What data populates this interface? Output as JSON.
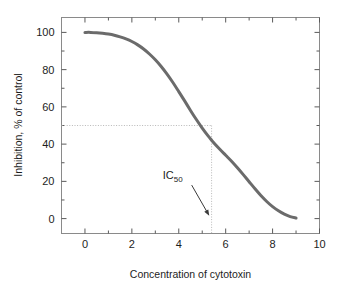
{
  "chart_data": {
    "type": "line",
    "title": "",
    "xlabel": "Concentration of cytotoxin",
    "ylabel": "Inhibition, % of control",
    "xlim": [
      -1,
      10
    ],
    "ylim": [
      -8,
      108
    ],
    "grid": false,
    "legend": null,
    "x_ticks": [
      "0",
      "2",
      "4",
      "6",
      "8",
      "10"
    ],
    "x_tick_values": [
      0,
      2,
      4,
      6,
      8,
      10
    ],
    "x_minor_tick_values": [
      1,
      3,
      5,
      7,
      9
    ],
    "y_ticks": [
      "0",
      "20",
      "40",
      "60",
      "80",
      "100"
    ],
    "y_tick_values": [
      0,
      20,
      40,
      60,
      80,
      100
    ],
    "y_minor_tick_values": [
      10,
      30,
      50,
      70,
      90
    ],
    "series": [
      {
        "name": "Inhibition curve",
        "color": "#6b6b6b",
        "linewidth": 3,
        "x": [
          0,
          0.25,
          0.5,
          0.75,
          1,
          1.25,
          1.5,
          1.75,
          2,
          2.25,
          2.5,
          2.75,
          3,
          3.25,
          3.5,
          3.75,
          4,
          4.25,
          4.5,
          4.75,
          5,
          5.25,
          5.4,
          5.5,
          5.75,
          6,
          6.25,
          6.5,
          6.75,
          7,
          7.25,
          7.5,
          7.75,
          8,
          8.25,
          8.5,
          8.75,
          9
        ],
        "values": [
          100,
          100,
          99.8,
          99.5,
          99.1,
          98.5,
          97.6,
          96.5,
          95.1,
          93.3,
          91.1,
          88.4,
          85.3,
          81.7,
          77.6,
          73.1,
          68.2,
          63.2,
          58.1,
          53.2,
          48.6,
          44.4,
          42.1,
          40.6,
          37.2,
          34.0,
          30.8,
          27.3,
          23.6,
          19.8,
          16.0,
          12.4,
          9.2,
          6.4,
          4.2,
          2.4,
          1.1,
          0.3
        ]
      }
    ],
    "annotations": [
      {
        "name": "ic50-marker",
        "text_main": "IC",
        "text_sub": "50",
        "x_value": 5.4,
        "y_value": 50,
        "guide_color": "#b8b8b8",
        "guide_style": "dotted",
        "arrow_from": [
          4.55,
          18
        ],
        "arrow_to": [
          5.3,
          1.5
        ]
      }
    ],
    "frame_color": "#8a8a8a",
    "background": "#ffffff"
  }
}
